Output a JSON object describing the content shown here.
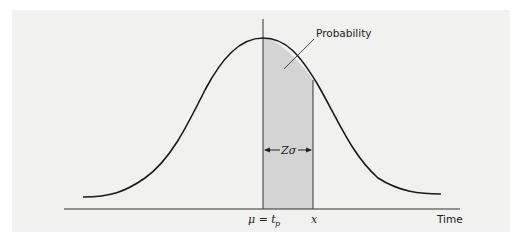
{
  "figure": {
    "type": "normal-distribution-diagram",
    "labels": {
      "probability": "Probability",
      "z_sigma": "Zσ",
      "mu_eq": "μ = t",
      "mu_sub": "p",
      "x": "x",
      "time_axis": "Time"
    },
    "colors": {
      "background": "#f1f1f0",
      "curve": "#1a1a1a",
      "shaded_area": "#d4d4d4",
      "axis": "#333333"
    }
  }
}
